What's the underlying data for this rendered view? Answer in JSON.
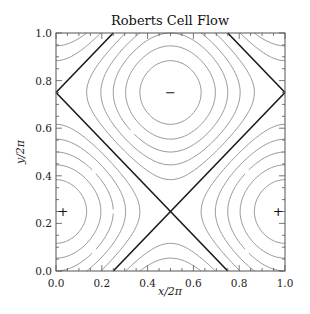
{
  "chart_data": {
    "type": "contour",
    "title": "Roberts Cell Flow",
    "xlabel": "x/2π",
    "ylabel": "y/2π",
    "xlim": [
      0.0,
      1.0
    ],
    "ylim": [
      0.0,
      1.0
    ],
    "xticks": [
      "0.0",
      "0.2",
      "0.4",
      "0.6",
      "0.8",
      "1.0"
    ],
    "yticks": [
      "0.0",
      "0.2",
      "0.4",
      "0.6",
      "0.8",
      "1.0"
    ],
    "function": "psi = cos(2*pi*x) + cos(2*pi*(y - 0.25))",
    "levels": [
      -1.667,
      -1.333,
      -1.0,
      -0.667,
      -0.333,
      0.333,
      0.667,
      1.0,
      1.333,
      1.667
    ],
    "separatrix_level": 0.0,
    "separatrix_lines": [
      [
        [
          0.0,
          0.75
        ],
        [
          0.25,
          1.0
        ]
      ],
      [
        [
          0.0,
          0.75
        ],
        [
          0.75,
          0.0
        ]
      ],
      [
        [
          0.25,
          0.0
        ],
        [
          1.0,
          0.75
        ]
      ],
      [
        [
          0.75,
          1.0
        ],
        [
          1.0,
          0.75
        ]
      ]
    ],
    "markers": [
      {
        "x": 0.5,
        "y": 0.75,
        "symbol": "−",
        "label": "minimum"
      },
      {
        "x": 0.03,
        "y": 0.25,
        "symbol": "+",
        "label": "maximum"
      },
      {
        "x": 0.97,
        "y": 0.25,
        "symbol": "+",
        "label": "maximum"
      }
    ],
    "grid": false,
    "legend": "none"
  },
  "colors": {
    "contour": "#8a8a8a",
    "separatrix": "#1a1a1a",
    "frame": "#555555",
    "text": "#222222"
  }
}
